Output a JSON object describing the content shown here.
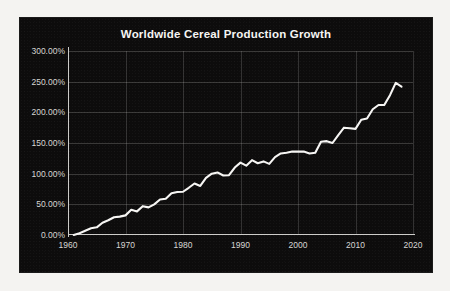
{
  "figure": {
    "background_color": "#f4f3f1",
    "panel_color": "#0d0c0c",
    "title": "Worldwide Cereal Production Growth"
  },
  "chart_data": {
    "type": "line",
    "title": "Worldwide Cereal Production Growth",
    "xlabel": "",
    "ylabel": "",
    "xlim": [
      1960,
      2020
    ],
    "ylim": [
      0,
      300
    ],
    "grid": true,
    "legend": null,
    "line_color": "#f7f6f4",
    "tick_label_color": "#d7d6d3",
    "y_tick_values": [
      0,
      50,
      100,
      150,
      200,
      250,
      300
    ],
    "y_tick_labels": [
      "0.00%",
      "50.00%",
      "100.00%",
      "150.00%",
      "200.00%",
      "250.00%",
      "300.00%"
    ],
    "x_tick_values": [
      1960,
      1970,
      1980,
      1990,
      2000,
      2010,
      2020
    ],
    "x_tick_labels": [
      "1960",
      "1970",
      "1980",
      "1990",
      "2000",
      "2010",
      "2020"
    ],
    "series": [
      {
        "name": "Worldwide Cereal Production Growth",
        "x": [
          1961,
          1962,
          1963,
          1964,
          1965,
          1966,
          1967,
          1968,
          1969,
          1970,
          1971,
          1972,
          1973,
          1974,
          1975,
          1976,
          1977,
          1978,
          1979,
          1980,
          1981,
          1982,
          1983,
          1984,
          1985,
          1986,
          1987,
          1988,
          1989,
          1990,
          1991,
          1992,
          1993,
          1994,
          1995,
          1996,
          1997,
          1998,
          1999,
          2000,
          2001,
          2002,
          2003,
          2004,
          2005,
          2006,
          2007,
          2008,
          2009,
          2010,
          2011,
          2012,
          2013,
          2014,
          2015,
          2016,
          2017,
          2018
        ],
        "values": [
          0.0,
          3.0,
          7.0,
          11.0,
          12.5,
          20.0,
          24.0,
          29.0,
          30.0,
          32.0,
          41.0,
          38.5,
          47.0,
          45.0,
          50.0,
          58.0,
          59.0,
          68.0,
          70.0,
          70.5,
          77.0,
          84.0,
          80.0,
          93.0,
          100.0,
          102.0,
          97.0,
          97.5,
          110.0,
          118.0,
          113.0,
          122.0,
          117.0,
          120.0,
          116.0,
          127.0,
          133.0,
          134.0,
          136.0,
          136.0,
          136.0,
          133.0,
          134.0,
          152.0,
          153.0,
          150.0,
          163.0,
          175.0,
          174.0,
          173.0,
          188.0,
          190.0,
          205.0,
          212.0,
          212.0,
          228.0,
          248.0,
          242.0
        ],
        "units": "percent"
      }
    ]
  }
}
